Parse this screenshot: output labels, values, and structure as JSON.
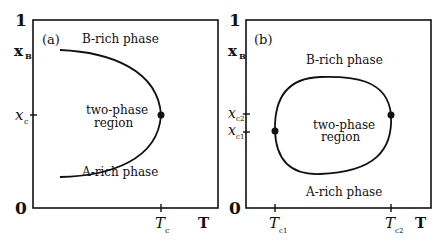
{
  "panel_a": {
    "tag": "(a)",
    "y_top": "1",
    "y_bottom": "0",
    "y_axis_label": "x",
    "y_axis_sub": "B",
    "x_axis_label": "T",
    "upper_region": "B-rich phase",
    "lower_region": "A-rich phase",
    "middle_line1": "two-phase",
    "middle_line2": "region",
    "y_tick": "x",
    "y_tick_sub": "c",
    "x_tick": "T",
    "x_tick_sub": "c"
  },
  "panel_b": {
    "tag": "(b)",
    "y_top": "1",
    "y_bottom": "0",
    "y_axis_label": "x",
    "y_axis_sub": "B",
    "x_axis_label": "T",
    "upper_region": "B-rich phase",
    "lower_region": "A-rich phase",
    "middle_line1": "two-phase",
    "middle_line2": "region",
    "y_tick_upper": "x",
    "y_tick_upper_sub": "c2",
    "y_tick_lower": "x",
    "y_tick_lower_sub": "c1",
    "x_tick_left": "T",
    "x_tick_left_sub": "c1",
    "x_tick_right": "T",
    "x_tick_right_sub": "c2"
  },
  "colors": {
    "line": "#111111",
    "background": "#ffffff"
  }
}
